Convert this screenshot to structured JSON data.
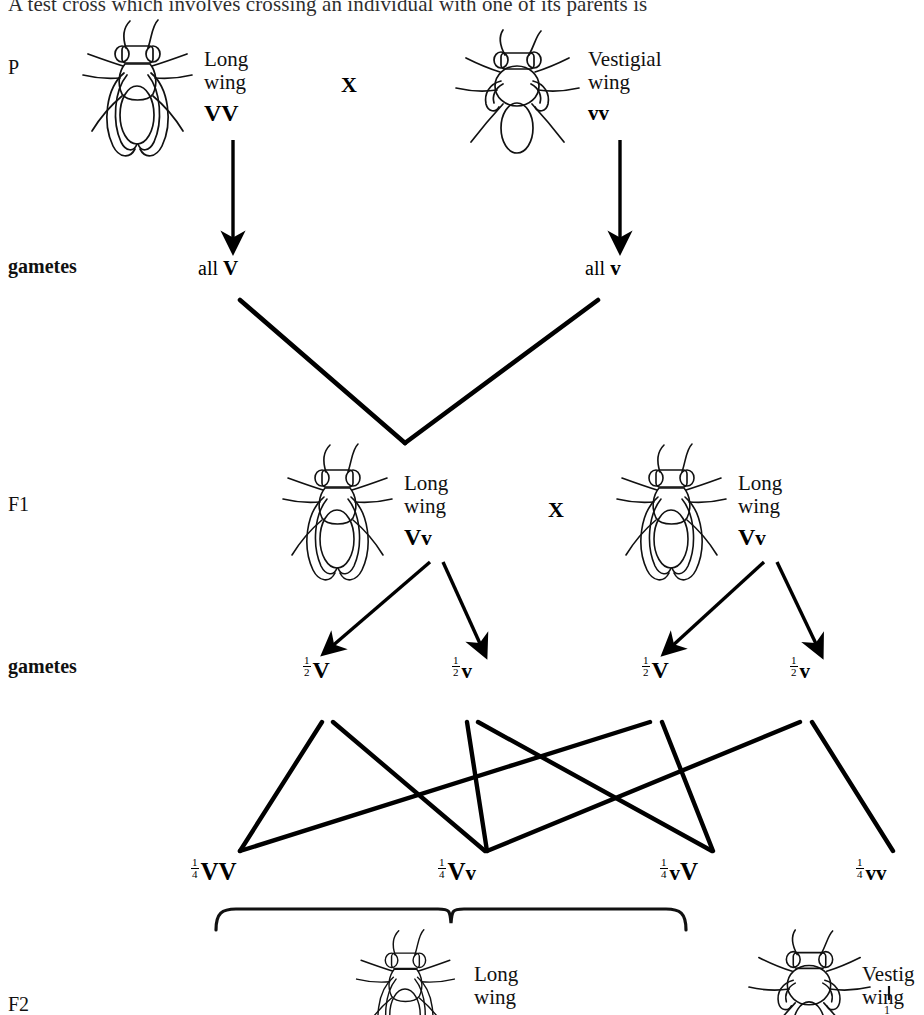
{
  "document": {
    "top_sentence": "A test cross which involves crossing an individual with one of its parents is"
  },
  "stages": {
    "p_label": "P",
    "gametes_label_1": "gametes",
    "f1_label": "F1",
    "gametes_label_2": "gametes",
    "f2_label": "F2"
  },
  "symbols": {
    "cross": "X",
    "dominant_allele": "V",
    "recessive_allele": "v"
  },
  "p_generation": {
    "parent_left": {
      "phenotype_line1": "Long",
      "phenotype_line2": "wing",
      "genotype_dom": "V",
      "genotype_rec": "V",
      "fly": "long-wing-fly"
    },
    "cross_symbol": "X",
    "parent_right": {
      "phenotype_line1": "Vestigial",
      "phenotype_line2": "wing",
      "genotype_dom": "v",
      "genotype_rec": "v",
      "fly": "vestigial-wing-fly"
    }
  },
  "p_gametes": {
    "left": {
      "quantifier": "all",
      "allele": "V"
    },
    "right": {
      "quantifier": "all",
      "allele": "v"
    }
  },
  "f1_generation": {
    "individual_left": {
      "phenotype_line1": "Long",
      "phenotype_line2": "wing",
      "genotype_dom": "V",
      "genotype_rec": "v",
      "fly": "long-wing-fly"
    },
    "cross_symbol": "X",
    "individual_right": {
      "phenotype_line1": "Long",
      "phenotype_line2": "wing",
      "genotype_dom": "V",
      "genotype_rec": "v",
      "fly": "long-wing-fly"
    }
  },
  "f1_gametes": [
    {
      "num": "1",
      "den": "2",
      "allele": "V",
      "case": "dominant"
    },
    {
      "num": "1",
      "den": "2",
      "allele": "v",
      "case": "recessive"
    },
    {
      "num": "1",
      "den": "2",
      "allele": "V",
      "case": "dominant"
    },
    {
      "num": "1",
      "den": "2",
      "allele": "v",
      "case": "recessive"
    }
  ],
  "f2_genotypes": [
    {
      "num": "1",
      "den": "4",
      "allele1": "V",
      "allele2": "V"
    },
    {
      "num": "1",
      "den": "4",
      "allele1": "V",
      "allele2": "v"
    },
    {
      "num": "1",
      "den": "4",
      "allele1": "v",
      "allele2": "V"
    },
    {
      "num": "1",
      "den": "4",
      "allele1": "v",
      "allele2": "v"
    }
  ],
  "f2_phenotypes": {
    "left": {
      "phenotype_line1": "Long",
      "phenotype_line2": "wing",
      "fly": "long-wing-fly",
      "bracket": "brace-over-three-genotypes"
    },
    "right": {
      "phenotype_line1": "Vestig",
      "phenotype_line2": "wing",
      "fly": "vestigial-wing-fly",
      "fraction_num": "1"
    }
  },
  "colors": {
    "ink": "#111111",
    "line": "#000000",
    "background": "#ffffff"
  }
}
